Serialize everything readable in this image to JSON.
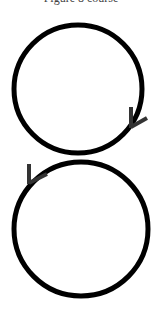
{
  "title": "Figure 8 course",
  "diagram": {
    "stroke_color": "#000000",
    "arrow_color": "#333333",
    "upper_loop": {
      "cx": 78,
      "cy": 89,
      "r": 64,
      "arrow_direction": "clockwise (down on right side)"
    },
    "lower_loop": {
      "cx": 81,
      "cy": 229,
      "r": 67,
      "arrow_direction": "counter-clockwise (down on left side)"
    }
  }
}
